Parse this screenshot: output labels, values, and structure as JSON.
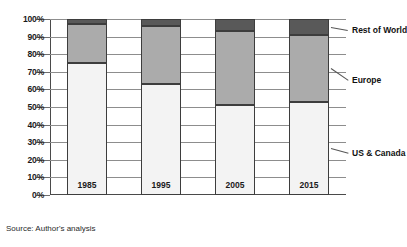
{
  "chart_data": {
    "type": "bar",
    "subtype": "stacked-100-percent",
    "title": "",
    "xlabel": "",
    "ylabel": "",
    "categories": [
      "1985",
      "1995",
      "2005",
      "2015"
    ],
    "ylim": [
      0,
      100
    ],
    "ytick_labels": [
      "0%",
      "10%",
      "20%",
      "30%",
      "40%",
      "50%",
      "60%",
      "70%",
      "80%",
      "90%",
      "100%"
    ],
    "ytick_values": [
      0,
      10,
      20,
      30,
      40,
      50,
      60,
      70,
      80,
      90,
      100
    ],
    "grid": true,
    "legend_position": "right-callouts",
    "series": [
      {
        "name": "US & Canada",
        "values": [
          75,
          63,
          51,
          53
        ],
        "color": "#f3f3f3"
      },
      {
        "name": "Europe",
        "values": [
          22,
          33,
          42,
          38
        ],
        "color": "#ababab"
      },
      {
        "name": "Rest of World",
        "values": [
          3,
          4,
          7,
          9
        ],
        "color": "#595959"
      }
    ],
    "annotations": [
      {
        "text": "Rest of World",
        "target_series": "Rest of World"
      },
      {
        "text": "Europe",
        "target_series": "Europe"
      },
      {
        "text": "US & Canada",
        "target_series": "US & Canada"
      }
    ],
    "source_note": "Source: Author's analysis"
  }
}
